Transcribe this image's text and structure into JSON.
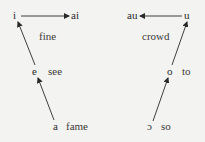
{
  "left_chain": {
    "vowels": {
      "i": "i",
      "ai": "ai",
      "e": "e",
      "a": "a"
    },
    "words": {
      "fine": "fine",
      "see": "see",
      "fame": "fame"
    }
  },
  "right_chain": {
    "vowels": {
      "u": "u",
      "au": "au",
      "o": "o",
      "open_o": "ɔ"
    },
    "words": {
      "crowd": "crowd",
      "to": "to",
      "so": "so"
    }
  },
  "arrows": [
    {
      "from": "a",
      "to": "e"
    },
    {
      "from": "e",
      "to": "i"
    },
    {
      "from": "i",
      "to": "ai"
    },
    {
      "from": "ɔ",
      "to": "o"
    },
    {
      "from": "o",
      "to": "u"
    },
    {
      "from": "u",
      "to": "au"
    }
  ],
  "colors": {
    "background": "#f3f3f1",
    "ink": "#2a2a2a"
  }
}
